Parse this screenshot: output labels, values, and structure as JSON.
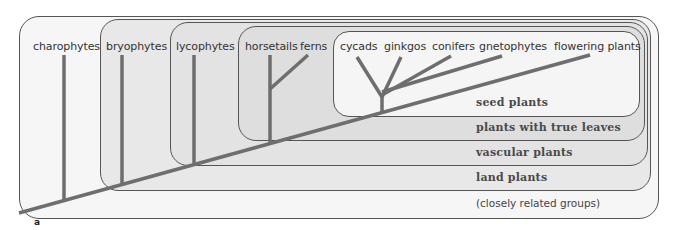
{
  "figure": {
    "panel_label": "a",
    "taxa": [
      {
        "id": "charophytes",
        "label": "charophytes"
      },
      {
        "id": "bryophytes",
        "label": "bryophytes"
      },
      {
        "id": "lycophytes",
        "label": "lycophytes"
      },
      {
        "id": "horsetails",
        "label": "horsetails"
      },
      {
        "id": "ferns",
        "label": "ferns"
      },
      {
        "id": "cycads",
        "label": "cycads"
      },
      {
        "id": "ginkgos",
        "label": "ginkgos"
      },
      {
        "id": "conifers",
        "label": "conifers"
      },
      {
        "id": "gnetophytes",
        "label": "gnetophytes"
      },
      {
        "id": "flowering-plants",
        "label": "flowering plants"
      }
    ],
    "groups": [
      {
        "id": "seed-plants",
        "label": "seed plants"
      },
      {
        "id": "true-leaves",
        "label": "plants with true leaves"
      },
      {
        "id": "vascular-plants",
        "label": "vascular plants"
      },
      {
        "id": "land-plants",
        "label": "land plants"
      },
      {
        "id": "closely-related",
        "label": "(closely related groups)"
      }
    ],
    "colors": {
      "branch": "#6e6e6e",
      "outline": "#555555",
      "text": "#333333"
    }
  }
}
